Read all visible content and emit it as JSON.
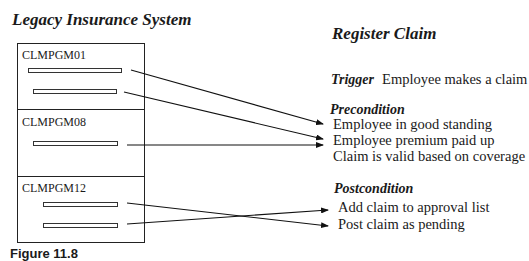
{
  "left_title": "Legacy Insurance System",
  "right_title": "Register Claim",
  "programs": [
    {
      "name": "CLMPGM01",
      "bars": 2
    },
    {
      "name": "CLMPGM08",
      "bars": 1
    },
    {
      "name": "CLMPGM12",
      "bars": 2
    }
  ],
  "trigger": {
    "label": "Trigger",
    "text": "Employee makes a claim"
  },
  "precondition": {
    "label": "Precondition",
    "items": [
      "Employee in good standing",
      "Employee premium paid up",
      "Claim is valid based on coverage"
    ]
  },
  "postcondition": {
    "label": "Postcondition",
    "items": [
      "Add claim to approval list",
      "Post claim as pending"
    ]
  },
  "caption": "Figure 11.8",
  "mappings": [
    {
      "from": "CLMPGM01 bar 1",
      "to": "Employee in good standing"
    },
    {
      "from": "CLMPGM01 bar 2",
      "to": "Employee premium paid up"
    },
    {
      "from": "CLMPGM08 bar 1",
      "to": "Employee premium paid up"
    },
    {
      "from": "CLMPGM12 bar 1",
      "to": "Post claim as pending"
    },
    {
      "from": "CLMPGM12 bar 2",
      "to": "Add claim to approval list"
    }
  ]
}
